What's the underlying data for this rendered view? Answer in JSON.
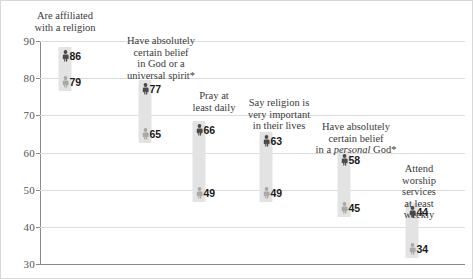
{
  "chart_data": {
    "type": "scatter",
    "title": "",
    "subtitle": "",
    "xlabel": "",
    "ylabel": "",
    "ylim": [
      30,
      90
    ],
    "yticks": [
      30,
      40,
      50,
      60,
      70,
      80,
      90
    ],
    "ytick_labels": [
      "30",
      "40",
      "50",
      "60",
      "70",
      "80",
      "90"
    ],
    "grid": true,
    "legend_position": "none",
    "categories": [
      "Are affiliated\nwith a religion",
      "Have absolutely\ncertain belief\nin God or a\nuniversal spirit*",
      "Pray at\nleast daily",
      "Say religion is\nvery important\nin their lives",
      "Have absolutely\ncertain belief\nin a personal God*",
      "Attend worship\nservices\nat least weekly"
    ],
    "series": [
      {
        "name": "upper",
        "values": [
          86,
          77,
          66,
          63,
          58,
          44
        ]
      },
      {
        "name": "lower",
        "values": [
          79,
          65,
          49,
          49,
          45,
          34
        ]
      }
    ],
    "points": [
      {
        "label": "Are affiliated\nwith a religion",
        "high": 86,
        "low": 79,
        "high_text": "86",
        "low_text": "79",
        "x": 64,
        "label_x": 64,
        "label_y": 9,
        "label_lines": 2,
        "italic_word": ""
      },
      {
        "label": "Have absolutely\ncertain belief\nin God or a\nuniversal spirit*",
        "high": 77,
        "low": 65,
        "high_text": "77",
        "low_text": "65",
        "x": 144,
        "label_x": 160,
        "label_y": 34,
        "label_lines": 4,
        "italic_word": ""
      },
      {
        "label": "Pray at\nleast daily",
        "high": 66,
        "low": 49,
        "high_text": "66",
        "low_text": "49",
        "x": 198,
        "label_x": 213,
        "label_y": 89,
        "label_lines": 2,
        "italic_word": ""
      },
      {
        "label": "Say religion is\nvery important\nin their lives",
        "high": 63,
        "low": 49,
        "high_text": "63",
        "low_text": "49",
        "x": 265,
        "label_x": 278,
        "label_y": 96,
        "label_lines": 3,
        "italic_word": ""
      },
      {
        "label": "Have absolutely\ncertain belief\nin a personal God*",
        "high": 58,
        "low": 45,
        "high_text": "58",
        "low_text": "45",
        "x": 343,
        "label_x": 355,
        "label_y": 120,
        "label_lines": 3,
        "italic_word": "personal"
      },
      {
        "label": "Attend worship\nservices\nat least weekly",
        "high": 44,
        "low": 34,
        "high_text": "44",
        "low_text": "34",
        "x": 411,
        "label_x": 418,
        "label_y": 162,
        "label_lines": 3,
        "italic_word": ""
      }
    ],
    "colors": {
      "high_marker": "#4a4a4a",
      "low_marker": "#a8a8a8",
      "band": "#e3e3e3",
      "gridline": "#dcdcdc",
      "axis": "#8a8a8a",
      "tick_text": "#555555",
      "category_text": "#3a3a3a",
      "value_text": "#1a1a1a",
      "background": "#ffffff",
      "frame": "#d8d8d8"
    },
    "footnote_marker": "*"
  }
}
